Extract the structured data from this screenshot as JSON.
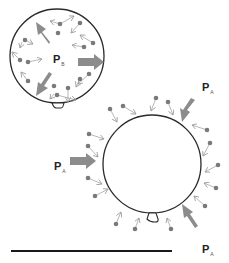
{
  "diagram": {
    "colors": {
      "outline": "#2a2a2a",
      "molecule": "#7a7a7a",
      "small_arrow": "#9a9a9a",
      "big_arrow": "#8c8c8c",
      "baseline": "#1a1a1a"
    },
    "balloon_inside": {
      "label_main": "P",
      "label_sub": "B",
      "description": "Left balloon with gas molecules inside pushing outward"
    },
    "balloon_outside": {
      "description": "Right balloon with gas molecules outside pushing inward"
    },
    "pressure_labels": [
      {
        "main": "P",
        "sub": "A",
        "position": "top-right"
      },
      {
        "main": "P",
        "sub": "A",
        "position": "left"
      },
      {
        "main": "P",
        "sub": "A",
        "position": "bottom-right"
      }
    ]
  }
}
